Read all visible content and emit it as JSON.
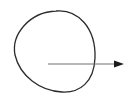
{
  "diagram": {
    "title": "",
    "shapes": [
      {
        "id": "closed-curve",
        "kind": "circle",
        "label": "",
        "stroke": "#2b2b2b"
      },
      {
        "id": "vector-arrow",
        "kind": "arrow",
        "direction": "right",
        "origin": "inside-circle",
        "exits_shape": true,
        "label": "",
        "stroke": "#707070",
        "head_fill": "#1a1a1a"
      }
    ]
  }
}
